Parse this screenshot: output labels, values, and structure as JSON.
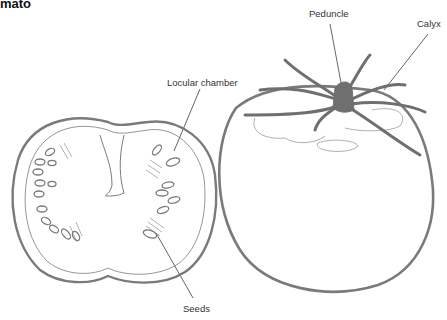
{
  "title": "mato",
  "labels": {
    "peduncle": "Peduncle",
    "calyx": "Calyx",
    "locular_chamber": "Locular chamber",
    "seeds": "Seeds"
  },
  "colors": {
    "outline": "#7a7a7a",
    "stem": "#6f6f6f",
    "leader": "#222222",
    "text": "#333333"
  }
}
